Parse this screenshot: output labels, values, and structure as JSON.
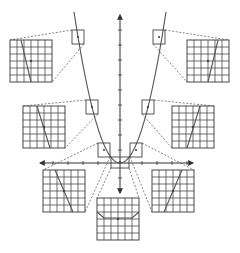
{
  "diagram": {
    "title": "Local linearity of a parabola: zooming in on points of y = x^2",
    "colors": {
      "ink": "#444444",
      "curve": "#555555",
      "grid": "#333333",
      "dashed": "#666666",
      "background": "#ffffff"
    },
    "axes": {
      "origin": [
        120,
        163
      ],
      "x_range_px": [
        40,
        193
      ],
      "y_range_px": [
        15,
        193
      ],
      "x_ticks_px": [
        53,
        68,
        83,
        98,
        142,
        157,
        172,
        187
      ],
      "y_ticks_px": [
        30,
        45,
        60,
        75,
        90,
        105,
        120,
        135,
        150,
        178
      ]
    },
    "curve": {
      "type": "parabola",
      "label": "y = x^2",
      "vertex": [
        120,
        163
      ]
    },
    "zoom_points": [
      {
        "id": "top-left",
        "point": [
          78,
          37
        ],
        "box": [
          72,
          30,
          12,
          14
        ],
        "grid": [
          10,
          40,
          42,
          42
        ],
        "line": [
          [
            21,
            40
          ],
          [
            31,
            82
          ]
        ]
      },
      {
        "id": "top-right",
        "point": [
          159,
          37
        ],
        "box": [
          153,
          30,
          12,
          14
        ],
        "grid": [
          187,
          40,
          42,
          42
        ],
        "line": [
          [
            218,
            40
          ],
          [
            208,
            82
          ]
        ]
      },
      {
        "id": "mid-left",
        "point": [
          92,
          107
        ],
        "box": [
          86,
          100,
          12,
          14
        ],
        "grid": [
          23,
          106,
          42,
          42
        ],
        "line": [
          [
            37,
            106
          ],
          [
            50,
            148
          ]
        ]
      },
      {
        "id": "mid-right",
        "point": [
          148,
          107
        ],
        "box": [
          142,
          100,
          12,
          14
        ],
        "grid": [
          172,
          106,
          42,
          42
        ],
        "line": [
          [
            200,
            106
          ],
          [
            187,
            148
          ]
        ]
      },
      {
        "id": "low-left",
        "point": [
          104,
          150
        ],
        "box": [
          98,
          143,
          12,
          14
        ],
        "grid": [
          43,
          170,
          42,
          42
        ],
        "line": [
          [
            55,
            170
          ],
          [
            73,
            212
          ]
        ]
      },
      {
        "id": "low-right",
        "point": [
          136,
          150
        ],
        "box": [
          130,
          143,
          12,
          14
        ],
        "grid": [
          152,
          170,
          42,
          42
        ],
        "line": [
          [
            182,
            170
          ],
          [
            164,
            212
          ]
        ]
      },
      {
        "id": "bottom",
        "point": [
          120,
          162
        ],
        "box": [
          111,
          157,
          18,
          11
        ],
        "grid": [
          97,
          198,
          42,
          42
        ],
        "line": [
          [
            97,
            212
          ],
          [
            104,
            218
          ],
          [
            132,
            218
          ],
          [
            139,
            212
          ]
        ]
      }
    ]
  }
}
